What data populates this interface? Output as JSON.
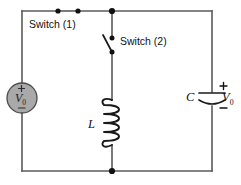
{
  "figure": {
    "type": "circuit-diagram",
    "width": 241,
    "height": 185
  },
  "colors": {
    "background": "#ffffff",
    "wire": "#5b5b5b",
    "component": "#1a1a1a",
    "node": "#111111",
    "source_fill": "#a9a9a9",
    "source_stroke": "#4a4a4a",
    "text": "#111111"
  },
  "labels": {
    "switch1": "Switch (1)",
    "switch2": "Switch (2)",
    "inductor": "L",
    "capacitor": "C",
    "capacitor_voltage": "V",
    "capacitor_voltage_sub": "0",
    "source_voltage": "V",
    "source_voltage_sub": "0",
    "plus": "+",
    "minus": "−"
  },
  "components": [
    {
      "name": "voltage-source",
      "kind": "dc-source",
      "label": "V0",
      "polarity_top": "+",
      "polarity_bottom": "−",
      "position": {
        "cx": 22,
        "cy": 98,
        "r": 15
      }
    },
    {
      "name": "switch-1",
      "kind": "switch",
      "state": "closed",
      "label": "Switch (1)",
      "contacts": [
        {
          "x": 58,
          "y": 11
        },
        {
          "x": 78,
          "y": 11
        }
      ]
    },
    {
      "name": "switch-2",
      "kind": "switch",
      "state": "open",
      "label": "Switch (2)",
      "contacts": [
        {
          "x": 112,
          "y": 38
        },
        {
          "x": 112,
          "y": 52
        }
      ]
    },
    {
      "name": "inductor",
      "kind": "inductor",
      "label": "L",
      "turns": 5,
      "position": {
        "x": 112,
        "y_top": 100,
        "y_bottom": 145
      }
    },
    {
      "name": "capacitor",
      "kind": "capacitor-polarized",
      "label": "C",
      "voltage_label": "V0",
      "polarity_top": "+",
      "polarity_bottom": "−",
      "position": {
        "x": 212,
        "y": 98
      }
    }
  ],
  "nodes": [
    {
      "name": "node-top-junction",
      "x": 112,
      "y": 11
    },
    {
      "name": "node-bottom-junction",
      "x": 112,
      "y": 171
    },
    {
      "name": "node-switch1-left",
      "x": 58,
      "y": 11
    },
    {
      "name": "node-switch1-right",
      "x": 78,
      "y": 11
    },
    {
      "name": "node-switch2-top",
      "x": 112,
      "y": 38
    },
    {
      "name": "node-switch2-bottom",
      "x": 112,
      "y": 52
    }
  ],
  "frame": {
    "left": 22,
    "top": 11,
    "right": 212,
    "bottom": 171
  }
}
